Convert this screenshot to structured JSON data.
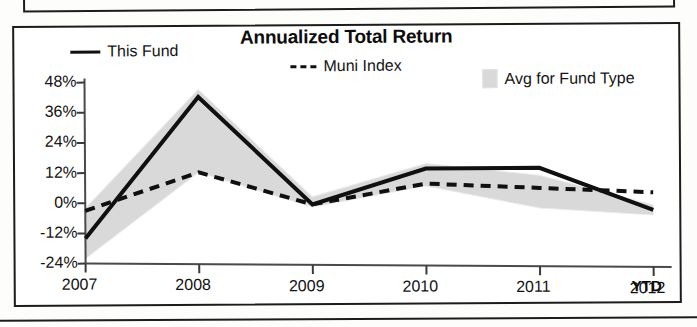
{
  "chart_data": {
    "type": "line",
    "title": "Annualized Total Return",
    "xlabel": "",
    "ylabel": "",
    "categories": [
      "2007",
      "2008",
      "2009",
      "2010",
      "2011",
      "2012"
    ],
    "x_axis_suffix": "YTD",
    "ytick_labels": [
      "48%",
      "36%",
      "24%",
      "12%",
      "0%",
      "-12%",
      "-24%"
    ],
    "ytick_values": [
      48,
      36,
      24,
      12,
      0,
      -12,
      -24
    ],
    "ylim": [
      -24,
      48
    ],
    "grid": false,
    "legend_position": "top",
    "series": [
      {
        "name": "This Fund",
        "style": "solid-line",
        "color": "#101010",
        "values": [
          -14,
          42,
          -1,
          13,
          13,
          -4
        ]
      },
      {
        "name": "Muni Index",
        "style": "dashed-line",
        "color": "#101010",
        "values": [
          -3,
          12,
          -1,
          7,
          5,
          3
        ]
      },
      {
        "name": "Avg for Fund Type",
        "style": "shaded-band",
        "color": "#d9d9d9",
        "upper": [
          -2,
          45,
          2,
          15,
          10,
          -2
        ],
        "lower": [
          -22,
          12,
          -2,
          6,
          -3,
          -6
        ]
      }
    ]
  },
  "legend": {
    "items": [
      {
        "label": "This Fund",
        "icon": "solid-line-swatch"
      },
      {
        "label": "Muni Index",
        "icon": "dashed-line-swatch"
      },
      {
        "label": "Avg for Fund Type",
        "icon": "shaded-band-swatch"
      }
    ]
  }
}
